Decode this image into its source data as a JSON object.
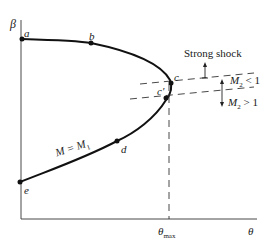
{
  "axes": {
    "y_label": "β",
    "x_label": "θ",
    "x_marker_label": "θ",
    "x_marker_sub": "max"
  },
  "points": {
    "a": "a",
    "b": "b",
    "c": "c",
    "c_prime": "c′",
    "d": "d",
    "e": "e"
  },
  "annotations": {
    "strong_shock": "Strong shock",
    "m2_less_var": "M",
    "m2_less_sub": "2",
    "m2_less_rel": " < 1",
    "m2_greater_var": "M",
    "m2_greater_sub": "2",
    "m2_greater_rel": " > 1",
    "curve_label_left": "M = M",
    "curve_label_sub": "1"
  },
  "colors": {
    "ink": "#1a1a1a",
    "background": "#ffffff"
  }
}
